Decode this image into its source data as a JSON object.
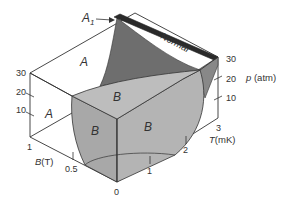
{
  "diagram": {
    "type": "3D phase diagram",
    "regions": {
      "a_upper": "A",
      "a_lower": "A",
      "b_top": "B",
      "b_left": "B",
      "b_right": "B",
      "normal": "Normal",
      "a1": "A",
      "a1_subscript": "1"
    },
    "axes": {
      "pressure": {
        "label_symbol": "p",
        "label_unit": " (atm)",
        "ticks": [
          "10",
          "20",
          "30"
        ],
        "ticks_left": [
          "10",
          "20",
          "30"
        ]
      },
      "temperature": {
        "label_symbol": "T",
        "label_unit": "(mK)",
        "ticks": [
          "0",
          "1",
          "2",
          "3"
        ]
      },
      "field": {
        "label_symbol": "B",
        "label_unit": "(T)",
        "ticks": [
          "0.5",
          "1"
        ]
      }
    },
    "colors": {
      "b_phase": "#b4b4b4",
      "b_phase_dark": "#a6a6a6",
      "a_phase_sheet": "#6e6e6e",
      "a1_sliver": "#2a2a2a",
      "edges": "#333333",
      "background": "#ffffff"
    }
  }
}
